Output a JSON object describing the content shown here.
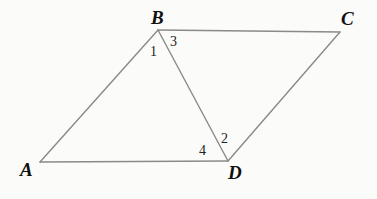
{
  "figure": {
    "background_color": "#fbfbfa",
    "line_color": "#8a8a8a",
    "line_width": 1.4,
    "label_color": "#111111",
    "vertices": [
      {
        "name": "A",
        "label": "A",
        "x": 40,
        "y": 162,
        "label_x": 20,
        "label_y": 160
      },
      {
        "name": "B",
        "label": "B",
        "x": 158,
        "y": 30,
        "label_x": 151,
        "label_y": 8
      },
      {
        "name": "C",
        "label": "C",
        "x": 340,
        "y": 32,
        "label_x": 341,
        "label_y": 9
      },
      {
        "name": "D",
        "label": "D",
        "x": 228,
        "y": 161,
        "label_x": 228,
        "label_y": 163
      }
    ],
    "edges": [
      {
        "name": "side-AB",
        "from": "A",
        "to": "B"
      },
      {
        "name": "side-BC",
        "from": "B",
        "to": "C"
      },
      {
        "name": "side-CD",
        "from": "C",
        "to": "D"
      },
      {
        "name": "side-DA",
        "from": "D",
        "to": "A"
      },
      {
        "name": "diagonal-BD",
        "from": "B",
        "to": "D"
      }
    ],
    "angle_labels": [
      {
        "name": "angle-1",
        "label": "1",
        "at_vertex": "B",
        "description": "angle ABD",
        "x": 150,
        "y": 45
      },
      {
        "name": "angle-3",
        "label": "3",
        "at_vertex": "B",
        "description": "angle DBC",
        "x": 170,
        "y": 35
      },
      {
        "name": "angle-2",
        "label": "2",
        "at_vertex": "D",
        "description": "angle BDC",
        "x": 221,
        "y": 132
      },
      {
        "name": "angle-4",
        "label": "4",
        "at_vertex": "D",
        "description": "angle ADB",
        "x": 199,
        "y": 144
      }
    ]
  }
}
